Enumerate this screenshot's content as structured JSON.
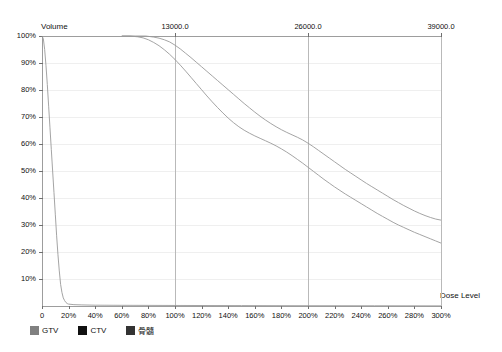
{
  "chart_data": {
    "type": "line",
    "title": "",
    "xlabel": "Dose Level",
    "ylabel": "Volume",
    "xlim": [
      0,
      300
    ],
    "ylim": [
      0,
      100
    ],
    "grid": true,
    "legend_position": "bottom-left",
    "x_tick_labels": [
      "0",
      "20%",
      "40%",
      "60%",
      "80%",
      "100%",
      "120%",
      "140%",
      "160%",
      "180%",
      "200%",
      "220%",
      "240%",
      "260%",
      "280%",
      "300%"
    ],
    "x_tick_values": [
      0,
      20,
      40,
      60,
      80,
      100,
      120,
      140,
      160,
      180,
      200,
      220,
      240,
      260,
      280,
      300
    ],
    "y_tick_labels": [
      "100%",
      "90%",
      "80%",
      "70%",
      "60%",
      "50%",
      "40%",
      "30%",
      "20%",
      "10%"
    ],
    "y_tick_values": [
      100,
      90,
      80,
      70,
      60,
      50,
      40,
      30,
      20,
      10
    ],
    "top_axis_label": "Dose (cGy)",
    "top_tick_labels": [
      "13000.0",
      "26000.0",
      "39000.0"
    ],
    "top_tick_values": [
      100,
      200,
      300
    ],
    "vertical_gridlines_at": [
      100,
      200,
      300
    ],
    "series": [
      {
        "name": "GTV",
        "color": "#9a9a9a",
        "points": [
          [
            60,
            100
          ],
          [
            70,
            100
          ],
          [
            78,
            100
          ],
          [
            84,
            99.6
          ],
          [
            88,
            99.2
          ],
          [
            92,
            98.6
          ],
          [
            96,
            97.8
          ],
          [
            100,
            96.6
          ],
          [
            104,
            95.2
          ],
          [
            108,
            93.6
          ],
          [
            112,
            92.0
          ],
          [
            116,
            90.3
          ],
          [
            120,
            88.6
          ],
          [
            124,
            86.9
          ],
          [
            128,
            85.2
          ],
          [
            132,
            83.5
          ],
          [
            136,
            81.8
          ],
          [
            140,
            80.1
          ],
          [
            144,
            78.4
          ],
          [
            148,
            76.7
          ],
          [
            152,
            75.0
          ],
          [
            156,
            73.4
          ],
          [
            160,
            71.8
          ],
          [
            164,
            70.3
          ],
          [
            168,
            68.9
          ],
          [
            172,
            67.6
          ],
          [
            176,
            66.4
          ],
          [
            180,
            65.3
          ],
          [
            184,
            64.3
          ],
          [
            188,
            63.4
          ],
          [
            192,
            62.5
          ],
          [
            196,
            61.5
          ],
          [
            200,
            60.3
          ],
          [
            204,
            59.0
          ],
          [
            208,
            57.6
          ],
          [
            212,
            56.2
          ],
          [
            216,
            54.8
          ],
          [
            220,
            53.4
          ],
          [
            224,
            52.0
          ],
          [
            228,
            50.6
          ],
          [
            232,
            49.3
          ],
          [
            236,
            48.0
          ],
          [
            240,
            46.7
          ],
          [
            244,
            45.4
          ],
          [
            248,
            44.2
          ],
          [
            252,
            43.0
          ],
          [
            256,
            41.8
          ],
          [
            260,
            40.6
          ],
          [
            264,
            39.4
          ],
          [
            268,
            38.3
          ],
          [
            272,
            37.2
          ],
          [
            276,
            36.2
          ],
          [
            280,
            35.2
          ],
          [
            284,
            34.3
          ],
          [
            288,
            33.5
          ],
          [
            292,
            32.8
          ],
          [
            296,
            32.2
          ],
          [
            300,
            31.8
          ]
        ]
      },
      {
        "name": "CTV",
        "color": "#9a9a9a",
        "points": [
          [
            60,
            100
          ],
          [
            66,
            100
          ],
          [
            72,
            99.7
          ],
          [
            76,
            99.3
          ],
          [
            80,
            98.6
          ],
          [
            84,
            97.6
          ],
          [
            88,
            96.4
          ],
          [
            92,
            94.9
          ],
          [
            96,
            93.2
          ],
          [
            100,
            91.3
          ],
          [
            104,
            89.2
          ],
          [
            108,
            87.0
          ],
          [
            112,
            84.7
          ],
          [
            116,
            82.4
          ],
          [
            120,
            80.1
          ],
          [
            124,
            77.8
          ],
          [
            128,
            75.6
          ],
          [
            132,
            73.5
          ],
          [
            136,
            71.5
          ],
          [
            140,
            69.6
          ],
          [
            144,
            67.9
          ],
          [
            148,
            66.4
          ],
          [
            152,
            65.1
          ],
          [
            156,
            64.0
          ],
          [
            160,
            63.0
          ],
          [
            164,
            62.1
          ],
          [
            168,
            61.2
          ],
          [
            172,
            60.3
          ],
          [
            176,
            59.3
          ],
          [
            180,
            58.2
          ],
          [
            184,
            57.0
          ],
          [
            188,
            55.7
          ],
          [
            192,
            54.3
          ],
          [
            196,
            52.9
          ],
          [
            200,
            51.4
          ],
          [
            204,
            49.9
          ],
          [
            208,
            48.4
          ],
          [
            212,
            46.9
          ],
          [
            216,
            45.5
          ],
          [
            220,
            44.1
          ],
          [
            224,
            42.8
          ],
          [
            228,
            41.5
          ],
          [
            232,
            40.3
          ],
          [
            236,
            39.1
          ],
          [
            240,
            37.9
          ],
          [
            244,
            36.7
          ],
          [
            248,
            35.5
          ],
          [
            252,
            34.3
          ],
          [
            256,
            33.2
          ],
          [
            260,
            32.1
          ],
          [
            264,
            31.0
          ],
          [
            268,
            30.0
          ],
          [
            272,
            29.1
          ],
          [
            276,
            28.2
          ],
          [
            280,
            27.3
          ],
          [
            284,
            26.5
          ],
          [
            288,
            25.7
          ],
          [
            292,
            24.9
          ],
          [
            296,
            24.1
          ],
          [
            300,
            23.3
          ]
        ]
      },
      {
        "name": "骨髓",
        "color": "#9a9a9a",
        "points": [
          [
            0,
            100
          ],
          [
            1,
            99
          ],
          [
            2,
            95
          ],
          [
            3,
            89
          ],
          [
            4,
            82
          ],
          [
            5,
            74
          ],
          [
            6,
            66
          ],
          [
            7,
            58
          ],
          [
            8,
            50
          ],
          [
            9,
            42
          ],
          [
            10,
            34
          ],
          [
            11,
            26
          ],
          [
            12,
            19
          ],
          [
            13,
            13
          ],
          [
            14,
            8
          ],
          [
            15,
            5
          ],
          [
            16,
            3
          ],
          [
            17,
            2
          ],
          [
            18,
            1.3
          ],
          [
            19,
            0.9
          ],
          [
            20,
            0.7
          ],
          [
            24,
            0.5
          ],
          [
            30,
            0.4
          ],
          [
            40,
            0.3
          ],
          [
            60,
            0.25
          ],
          [
            100,
            0.2
          ],
          [
            150,
            0.15
          ],
          [
            200,
            0.1
          ],
          [
            250,
            0.08
          ],
          [
            300,
            0.05
          ]
        ]
      }
    ]
  },
  "legend": {
    "items": [
      {
        "label": "GTV",
        "color": "#808080"
      },
      {
        "label": "CTV",
        "color": "#111111"
      },
      {
        "label": "骨髓",
        "color": "#333333"
      }
    ]
  }
}
